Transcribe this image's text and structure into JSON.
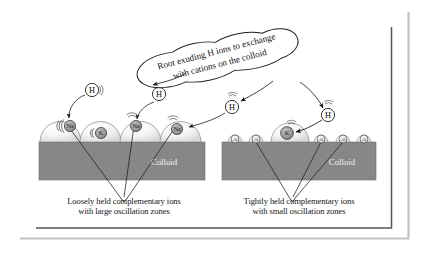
{
  "figure": {
    "title_note": "Cation exchange on soil colloid diagram",
    "callout": {
      "line1": "Root exuding H ions to exchange",
      "line2": "with cations on the colloid"
    },
    "colloid_label_left": "Colloid",
    "colloid_label_right": "Colloid",
    "captions": {
      "left_line1": "Loosely held complementary ions",
      "left_line2": "with large oscillation zones",
      "right_line1": "Tightly held complementary ions",
      "right_line2": "with small oscillation zones"
    },
    "h_ions": [
      {
        "id": "h-left-1",
        "label": "H"
      },
      {
        "id": "h-left-2",
        "label": "H"
      },
      {
        "id": "h-mid",
        "label": "H"
      },
      {
        "id": "h-right",
        "label": "H"
      }
    ],
    "left_panel": {
      "name": "loosely-held-ions-panel",
      "ions": [
        {
          "label": "Na",
          "size": "large"
        },
        {
          "label": "K",
          "size": "large"
        },
        {
          "label": "Na",
          "size": "large"
        },
        {
          "label": "Na",
          "size": "large"
        }
      ]
    },
    "right_panel": {
      "name": "tightly-held-ions-panel",
      "ions": [
        {
          "label": "Al",
          "size": "small"
        },
        {
          "label": "Al",
          "size": "small"
        },
        {
          "label": "K",
          "size": "large"
        },
        {
          "label": "Al",
          "size": "small"
        },
        {
          "label": "Al",
          "size": "small"
        },
        {
          "label": "Al",
          "size": "small"
        }
      ]
    },
    "colors": {
      "colloid_fill": "#878787",
      "dome_fill": "#f3f3f3",
      "ion_fill": "#9a9a9a",
      "ion_small_fill": "#e8e8e8",
      "line": "#1d1d1d",
      "border_inner": "#4a4a4a",
      "border_outer": "#b6b6b6",
      "background": "#ffffff"
    }
  }
}
